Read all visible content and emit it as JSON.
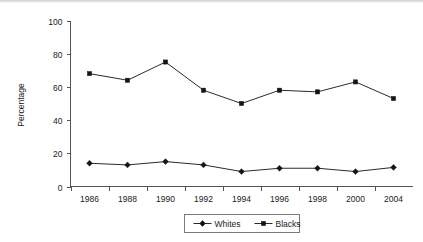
{
  "chart_data": {
    "type": "line",
    "title": "",
    "subtitle": "",
    "xlabel": "",
    "ylabel": "Percentage",
    "categories": [
      "1986",
      "1988",
      "1990",
      "1992",
      "1994",
      "1996",
      "1998",
      "2000",
      "2004"
    ],
    "ylim": [
      0,
      100
    ],
    "yticks": [
      "0",
      "20",
      "40",
      "60",
      "80",
      "100"
    ],
    "ytick_values": [
      0,
      20,
      40,
      60,
      80,
      100
    ],
    "grid": false,
    "legend_position": "bottom-center",
    "series": [
      {
        "name": "Whites",
        "marker": "diamond",
        "color": "#151515",
        "values": [
          14,
          13,
          15,
          13,
          9,
          11,
          11,
          9,
          11.5
        ]
      },
      {
        "name": "Blacks",
        "marker": "square",
        "color": "#151515",
        "values": [
          68,
          64,
          75,
          58,
          50,
          58,
          57,
          63,
          53
        ]
      }
    ]
  },
  "legend": {
    "entries": [
      {
        "label": "Whites",
        "marker": "diamond-marker"
      },
      {
        "label": "Blacks",
        "marker": "square-marker"
      }
    ]
  },
  "colors": {
    "axis": "#555555",
    "line": "#2b2b2b",
    "marker": "#151515",
    "background": "#ffffff",
    "legend_border": "#7a7a7a"
  }
}
